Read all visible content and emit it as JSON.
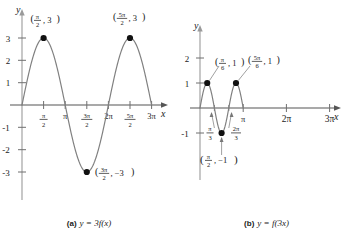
{
  "figure": {
    "panel_a": {
      "caption_tag": "(a)",
      "caption_equation": "y = 3f(x)",
      "axis_x_label": "x",
      "axis_y_label": "y",
      "x_ticks": [
        "π/2",
        "π",
        "3π/2",
        "2π",
        "5π/2",
        "3π"
      ],
      "y_ticks": [
        "3",
        "2",
        "1",
        "-1",
        "-2",
        "-3"
      ],
      "point_labels": [
        "(π/2 , 3)",
        "(5π/2 , 3)",
        "(3π/2 , -3)"
      ]
    },
    "panel_b": {
      "caption_tag": "(b)",
      "caption_equation": "y = f(3x)",
      "axis_x_label": "x",
      "axis_y_label": "y",
      "x_ticks": [
        "π",
        "2π",
        "3π"
      ],
      "y_ticks": [
        "2",
        "1",
        "-1"
      ],
      "annotation_ticks": [
        "π/3",
        "2π/3"
      ],
      "point_labels": [
        "(π/6 , 1)",
        "(5π/6 , 1)",
        "(π/2 , -1)"
      ]
    }
  },
  "chart_data": [
    {
      "type": "line",
      "id": "panel-a",
      "title": "(a) y = 3f(x)",
      "function": "y = 3 sin(x)",
      "xlabel": "x",
      "ylabel": "y",
      "xlim": [
        0,
        10.2
      ],
      "ylim": [
        -3.6,
        3.6
      ],
      "grid": false,
      "legend": "none",
      "amplitude": 3,
      "period": 6.283185307,
      "xtick_values": [
        1.5708,
        3.14159,
        4.71239,
        6.28319,
        7.85398,
        9.42478
      ],
      "xtick_labels": [
        "π/2",
        "π",
        "3π/2",
        "2π",
        "5π/2",
        "3π"
      ],
      "ytick_values": [
        3,
        2,
        1,
        -1,
        -2,
        -3
      ],
      "ytick_labels": [
        "3",
        "2",
        "1",
        "-1",
        "-2",
        "-3"
      ],
      "marked_points": [
        {
          "x": 1.5708,
          "y": 3,
          "label": "(π/2 , 3)"
        },
        {
          "x": 7.85398,
          "y": 3,
          "label": "(5π/2 , 3)"
        },
        {
          "x": 4.71239,
          "y": -3,
          "label": "(3π/2 , -3)"
        }
      ],
      "x": [
        0,
        0.3927,
        0.7854,
        1.1781,
        1.5708,
        1.9635,
        2.3562,
        2.7489,
        3.1416,
        3.5343,
        3.927,
        4.3197,
        4.7124,
        5.1051,
        5.4978,
        5.8905,
        6.2832,
        6.6759,
        7.0686,
        7.4613,
        7.854,
        8.2467,
        8.6394,
        9.0321,
        9.4248
      ],
      "y": [
        0,
        1.1481,
        2.1213,
        2.7716,
        3,
        2.7716,
        2.1213,
        1.1481,
        0,
        -1.1481,
        -2.1213,
        -2.7716,
        -3,
        -2.7716,
        -2.1213,
        -1.1481,
        0,
        1.1481,
        2.1213,
        2.7716,
        3,
        2.7716,
        2.1213,
        1.1481,
        0
      ]
    },
    {
      "type": "line",
      "id": "panel-b",
      "title": "(b) y = f(3x)",
      "function": "y = sin(3x)",
      "xlabel": "x",
      "ylabel": "y",
      "xlim": [
        0,
        10.2
      ],
      "ylim": [
        -1.6,
        2.4
      ],
      "grid": false,
      "legend": "none",
      "amplitude": 1,
      "period": 2.0944,
      "xtick_values": [
        3.14159,
        6.28319,
        9.42478
      ],
      "xtick_labels": [
        "π",
        "2π",
        "3π"
      ],
      "ytick_values": [
        2,
        1,
        -1
      ],
      "ytick_labels": [
        "2",
        "1",
        "-1"
      ],
      "annotation_x_values": [
        1.0472,
        2.0944
      ],
      "annotation_x_labels": [
        "π/3",
        "2π/3"
      ],
      "marked_points": [
        {
          "x": 0.5236,
          "y": 1,
          "label": "(π/6 , 1)"
        },
        {
          "x": 2.618,
          "y": 1,
          "label": "(5π/6 , 1)"
        },
        {
          "x": 1.5708,
          "y": -1,
          "label": "(π/2 , -1)"
        }
      ],
      "x": [
        0,
        0.1309,
        0.2618,
        0.3927,
        0.5236,
        0.6545,
        0.7854,
        0.9163,
        1.0472,
        1.1781,
        1.309,
        1.4399,
        1.5708,
        1.7017,
        1.8326,
        1.9635,
        2.0944,
        2.2253,
        2.3562,
        2.4871,
        2.618,
        2.7489,
        2.8798,
        3.0107,
        3.1416
      ],
      "y": [
        0,
        0.3827,
        0.7071,
        0.9239,
        1,
        0.9239,
        0.7071,
        0.3827,
        0,
        -0.3827,
        -0.7071,
        -0.9239,
        -1,
        -0.9239,
        -0.7071,
        -0.3827,
        0,
        0.3827,
        0.7071,
        0.9239,
        1,
        0.9239,
        0.7071,
        0.3827,
        0
      ]
    }
  ]
}
